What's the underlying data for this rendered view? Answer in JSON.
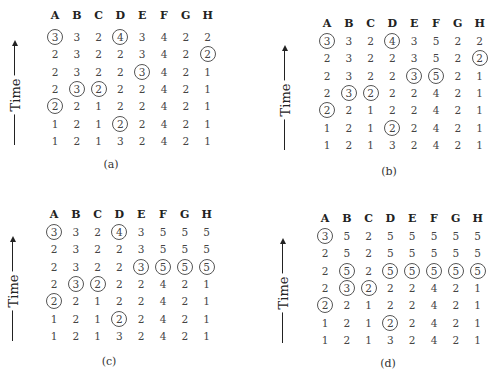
{
  "columns": [
    "A",
    "B",
    "C",
    "D",
    "E",
    "F",
    "G",
    "H"
  ],
  "time_label": "Time",
  "panels": [
    {
      "caption": "(a)",
      "rows": [
        [
          3,
          3,
          2,
          4,
          3,
          4,
          2,
          2
        ],
        [
          2,
          3,
          2,
          2,
          3,
          4,
          2,
          2
        ],
        [
          2,
          3,
          2,
          2,
          3,
          4,
          2,
          1
        ],
        [
          2,
          3,
          2,
          2,
          2,
          4,
          2,
          1
        ],
        [
          2,
          2,
          1,
          2,
          2,
          4,
          2,
          1
        ],
        [
          1,
          2,
          1,
          2,
          2,
          4,
          2,
          1
        ],
        [
          1,
          2,
          1,
          3,
          2,
          4,
          2,
          1
        ]
      ],
      "circled": [
        [
          0,
          0
        ],
        [
          0,
          3
        ],
        [
          1,
          7
        ],
        [
          2,
          4
        ],
        [
          3,
          1
        ],
        [
          3,
          2
        ],
        [
          4,
          0
        ],
        [
          5,
          3
        ]
      ]
    },
    {
      "caption": "(b)",
      "rows": [
        [
          3,
          3,
          2,
          4,
          3,
          5,
          2,
          2
        ],
        [
          2,
          3,
          2,
          2,
          3,
          5,
          2,
          2
        ],
        [
          2,
          3,
          2,
          2,
          3,
          5,
          2,
          1
        ],
        [
          2,
          3,
          2,
          2,
          2,
          4,
          2,
          1
        ],
        [
          2,
          2,
          1,
          2,
          2,
          4,
          2,
          1
        ],
        [
          1,
          2,
          1,
          2,
          2,
          4,
          2,
          1
        ],
        [
          1,
          2,
          1,
          3,
          2,
          4,
          2,
          1
        ]
      ],
      "circled": [
        [
          0,
          0
        ],
        [
          0,
          3
        ],
        [
          1,
          7
        ],
        [
          2,
          4
        ],
        [
          2,
          5
        ],
        [
          3,
          1
        ],
        [
          3,
          2
        ],
        [
          4,
          0
        ],
        [
          5,
          3
        ]
      ]
    },
    {
      "caption": "(c)",
      "rows": [
        [
          3,
          3,
          2,
          4,
          3,
          5,
          5,
          5
        ],
        [
          2,
          3,
          2,
          2,
          3,
          5,
          5,
          5
        ],
        [
          2,
          3,
          2,
          2,
          3,
          5,
          5,
          5
        ],
        [
          2,
          3,
          2,
          2,
          2,
          4,
          2,
          1
        ],
        [
          2,
          2,
          1,
          2,
          2,
          4,
          2,
          1
        ],
        [
          1,
          2,
          1,
          2,
          2,
          4,
          2,
          1
        ],
        [
          1,
          2,
          1,
          3,
          2,
          4,
          2,
          1
        ]
      ],
      "circled": [
        [
          0,
          0
        ],
        [
          0,
          3
        ],
        [
          2,
          4
        ],
        [
          2,
          5
        ],
        [
          2,
          6
        ],
        [
          2,
          7
        ],
        [
          3,
          1
        ],
        [
          3,
          2
        ],
        [
          4,
          0
        ],
        [
          5,
          3
        ]
      ]
    },
    {
      "caption": "(d)",
      "rows": [
        [
          3,
          5,
          2,
          5,
          5,
          5,
          5,
          5
        ],
        [
          2,
          5,
          2,
          5,
          5,
          5,
          5,
          5
        ],
        [
          2,
          5,
          2,
          5,
          5,
          5,
          5,
          5
        ],
        [
          2,
          3,
          2,
          2,
          2,
          4,
          2,
          1
        ],
        [
          2,
          2,
          1,
          2,
          2,
          4,
          2,
          1
        ],
        [
          1,
          2,
          1,
          2,
          2,
          4,
          2,
          1
        ],
        [
          1,
          2,
          1,
          3,
          2,
          4,
          2,
          1
        ]
      ],
      "circled": [
        [
          0,
          0
        ],
        [
          2,
          1
        ],
        [
          2,
          3
        ],
        [
          2,
          4
        ],
        [
          2,
          5
        ],
        [
          2,
          6
        ],
        [
          2,
          7
        ],
        [
          3,
          1
        ],
        [
          3,
          2
        ],
        [
          4,
          0
        ],
        [
          5,
          3
        ]
      ]
    }
  ]
}
